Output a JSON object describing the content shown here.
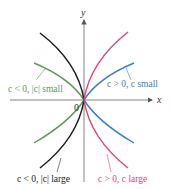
{
  "diagram": {
    "axes": {
      "x_label": "x",
      "y_label": "y",
      "origin_label": "0"
    },
    "curves": [
      {
        "id": "neg-small",
        "label": "c < 0, |c| small",
        "color": "#5a9a5a"
      },
      {
        "id": "pos-small",
        "label": "c > 0, c small",
        "color": "#3a7cc8"
      },
      {
        "id": "neg-large",
        "label": "c < 0, |c| large",
        "color": "#1a1a1a"
      },
      {
        "id": "pos-large",
        "label": "c > 0, c large",
        "color": "#e0457b"
      }
    ]
  }
}
